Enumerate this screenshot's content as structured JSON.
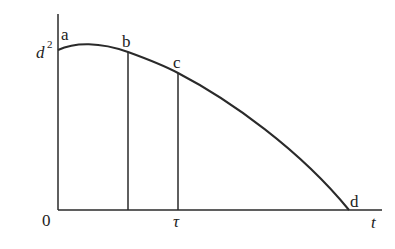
{
  "diagram": {
    "type": "function-curve",
    "stroke_color": "#2a2a2a",
    "background": "#ffffff",
    "axes": {
      "origin_label": "0",
      "x_label": "t",
      "y_tick_label_base": "d",
      "y_tick_label_exp": "2",
      "x_tick_label": "τ"
    },
    "points": [
      {
        "id": "a",
        "label": "a"
      },
      {
        "id": "b",
        "label": "b"
      },
      {
        "id": "c",
        "label": "c"
      },
      {
        "id": "d",
        "label": "d"
      }
    ]
  }
}
